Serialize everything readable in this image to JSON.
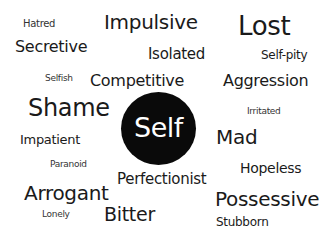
{
  "center": {
    "label": "Self",
    "circle_color": "#0a0a0a",
    "text_color": "#ffffff"
  },
  "text_color": "#1a1a1a",
  "words": [
    {
      "label": "Hatred",
      "x": 23,
      "y": 19,
      "size": 10
    },
    {
      "label": "Impulsive",
      "x": 104,
      "y": 12,
      "size": 20
    },
    {
      "label": "Lost",
      "x": 238,
      "y": 13,
      "size": 26
    },
    {
      "label": "Secretive",
      "x": 15,
      "y": 39,
      "size": 16
    },
    {
      "label": "Isolated",
      "x": 148,
      "y": 47,
      "size": 15
    },
    {
      "label": "Self-pity",
      "x": 261,
      "y": 49,
      "size": 12
    },
    {
      "label": "Selfish",
      "x": 45,
      "y": 74,
      "size": 9
    },
    {
      "label": "Competitive",
      "x": 90,
      "y": 73,
      "size": 16
    },
    {
      "label": "Aggression",
      "x": 223,
      "y": 73,
      "size": 16
    },
    {
      "label": "Shame",
      "x": 28,
      "y": 96,
      "size": 24
    },
    {
      "label": "Irritated",
      "x": 247,
      "y": 107,
      "size": 9
    },
    {
      "label": "Impatient",
      "x": 20,
      "y": 133,
      "size": 13
    },
    {
      "label": "Mad",
      "x": 216,
      "y": 127,
      "size": 20
    },
    {
      "label": "Paranoid",
      "x": 50,
      "y": 160,
      "size": 9
    },
    {
      "label": "Hopeless",
      "x": 240,
      "y": 161,
      "size": 14
    },
    {
      "label": "Perfectionist",
      "x": 117,
      "y": 172,
      "size": 15
    },
    {
      "label": "Arrogant",
      "x": 24,
      "y": 183,
      "size": 20
    },
    {
      "label": "Possessive",
      "x": 215,
      "y": 189,
      "size": 20
    },
    {
      "label": "Lonely",
      "x": 42,
      "y": 210,
      "size": 9
    },
    {
      "label": "Bitter",
      "x": 104,
      "y": 205,
      "size": 19
    },
    {
      "label": "Stubborn",
      "x": 216,
      "y": 216,
      "size": 12
    }
  ]
}
